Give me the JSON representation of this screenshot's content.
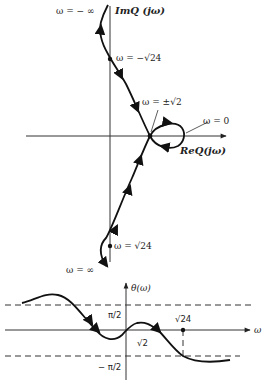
{
  "nyquist": {
    "imag_axis_label": "ImQ (jω)",
    "real_axis_label": "ReQ(jω)",
    "labels": {
      "w_minus_inf": "ω  =  − ∞",
      "w_minus_sqrt24": "ω  =  −√24",
      "w_pm_sqrt2": "ω  =  ±√2",
      "w_zero": "ω  =  0",
      "w_sqrt24": "ω =  √24",
      "w_inf": "ω  =  ∞"
    }
  },
  "phase_plot": {
    "y_axis_label": "θ(ω)",
    "x_axis_label": "ω",
    "pi_over_2": "π/2",
    "minus_pi_over_2": "− π/2",
    "sqrt2": "√2",
    "sqrt24": "√24"
  },
  "colors": {
    "curve": "#111111",
    "axis": "#333333",
    "background": "#ffffff"
  }
}
